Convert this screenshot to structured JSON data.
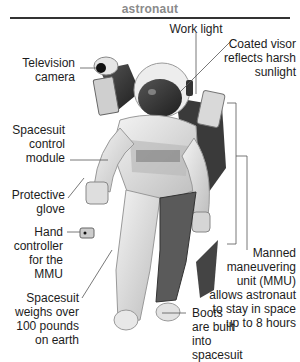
{
  "header": {
    "title": "astronaut"
  },
  "labels": {
    "work_light": "Work light",
    "visor": [
      "Coated visor",
      "reflects harsh",
      "sunlight"
    ],
    "tv_camera": [
      "Television",
      "camera"
    ],
    "control_module": [
      "Spacesuit",
      "control",
      "module"
    ],
    "glove": [
      "Protective",
      "glove"
    ],
    "hand_controller": [
      "Hand",
      "controller",
      "for the",
      "MMU"
    ],
    "weight": [
      "Spacesuit",
      "weighs over",
      "100 pounds",
      "on earth"
    ],
    "boots": [
      "Boots",
      "are built",
      "into",
      "spacesuit"
    ],
    "mmu": [
      "Manned",
      "maneuvering",
      "unit (MMU)",
      "allows astronaut",
      "to stay in space",
      "up to 8 hours"
    ]
  },
  "colors": {
    "header_text": "#8a8a8a",
    "rule": "#333333",
    "leader": "#555555",
    "text": "#1c1c1c"
  }
}
